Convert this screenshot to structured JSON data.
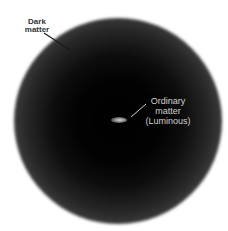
{
  "figure": {
    "labels": {
      "dark_matter": [
        "Dark",
        "matter"
      ],
      "ordinary_matter": [
        "Ordinary",
        "matter",
        "(Luminous)"
      ]
    },
    "colors": {
      "halo_center": "#000000",
      "halo_edge": "#8a8a8a",
      "background": "#ffffff",
      "label_dark": "#333333",
      "label_light": "#d0d0d0"
    }
  }
}
